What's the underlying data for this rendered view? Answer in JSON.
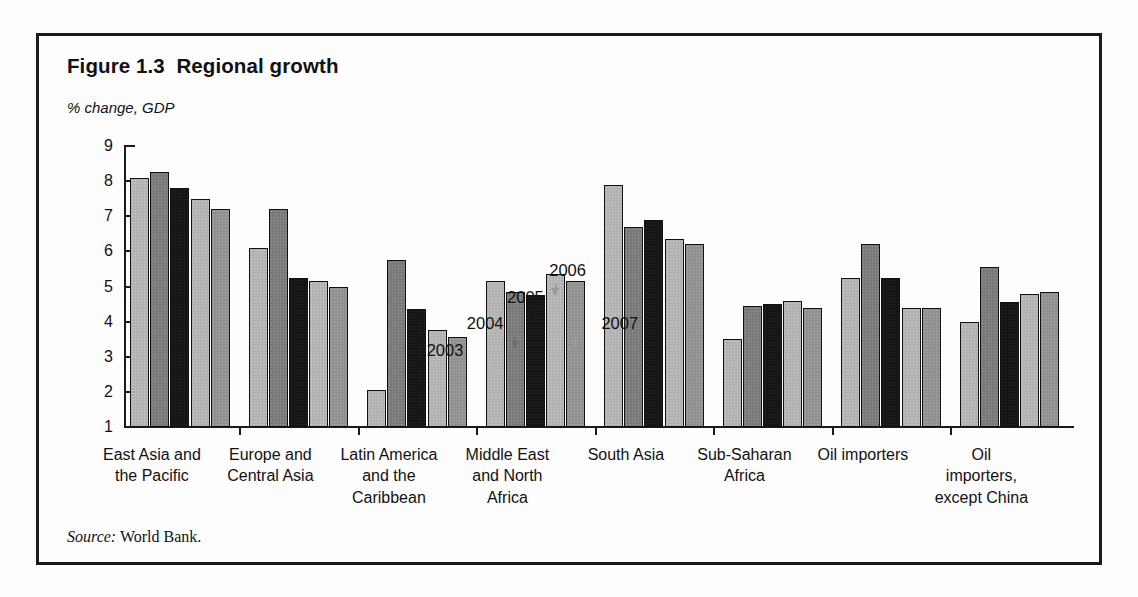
{
  "figure": {
    "title": "Figure 1.3  Regional growth",
    "axis_unit": "% change, GDP",
    "source_prefix": "Source:",
    "source_text": " World Bank."
  },
  "chart_data": {
    "type": "bar",
    "title": "Figure 1.3  Regional growth",
    "xlabel": "",
    "ylabel": "% change, GDP",
    "ylim": [
      1,
      9
    ],
    "yticks": [
      1,
      2,
      3,
      4,
      5,
      6,
      7,
      8,
      9
    ],
    "ytick_labels": [
      "1",
      "2",
      "3",
      "4",
      "5",
      "6",
      "7",
      "8",
      "9"
    ],
    "grid": false,
    "legend_position": "inline-annotations",
    "categories": [
      "East Asia and\nthe Pacific",
      "Europe and\nCentral Asia",
      "Latin America\nand the\nCaribbean",
      "Middle East\nand North\nAfrica",
      "South Asia",
      "Sub-Saharan\nAfrica",
      "Oil importers",
      "Oil importers,\nexcept China"
    ],
    "series": [
      {
        "name": "2003",
        "color": "#b5b5b5",
        "values": [
          8.1,
          6.1,
          2.05,
          5.15,
          7.9,
          3.5,
          5.25,
          4.0
        ]
      },
      {
        "name": "2004",
        "color": "#7d7d7d",
        "values": [
          8.25,
          7.2,
          5.75,
          4.85,
          6.7,
          4.45,
          6.2,
          5.55
        ]
      },
      {
        "name": "2005",
        "color": "#171717",
        "values": [
          7.8,
          5.25,
          4.35,
          4.75,
          6.9,
          4.5,
          5.25,
          4.55
        ]
      },
      {
        "name": "2006",
        "color": "#b5b5b5",
        "values": [
          7.5,
          5.15,
          3.75,
          5.35,
          6.35,
          4.6,
          4.4,
          4.8
        ]
      },
      {
        "name": "2007",
        "color": "#949494",
        "values": [
          7.2,
          5.0,
          3.55,
          5.15,
          6.2,
          4.4,
          4.4,
          4.85
        ]
      }
    ],
    "annotations": [
      {
        "label": "2003",
        "target_series": "2003",
        "target_category": "Middle East and North Africa"
      },
      {
        "label": "2004",
        "target_series": "2004",
        "target_category": "Middle East and North Africa"
      },
      {
        "label": "2005",
        "target_series": "2005",
        "target_category": "Middle East and North Africa"
      },
      {
        "label": "2006",
        "target_series": "2006",
        "target_category": "Middle East and North Africa"
      },
      {
        "label": "2007",
        "target_series": "2007",
        "target_category": "Middle East and North Africa"
      }
    ]
  }
}
